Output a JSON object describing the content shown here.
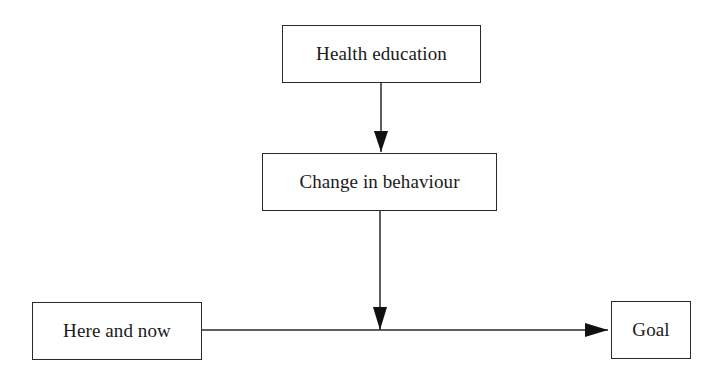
{
  "diagram": {
    "type": "flowchart",
    "nodes": {
      "health_education": {
        "label": "Health education"
      },
      "change_in_behaviour": {
        "label": "Change in behaviour"
      },
      "here_and_now": {
        "label": "Here and now"
      },
      "goal": {
        "label": "Goal"
      }
    },
    "edges": [
      {
        "from": "Health education",
        "to": "Change in behaviour"
      },
      {
        "from": "Change in behaviour",
        "to": "Here and now → Goal path (midpoint)"
      },
      {
        "from": "Here and now",
        "to": "Goal"
      }
    ],
    "colors": {
      "stroke": "#2a2a2a",
      "background": "#ffffff",
      "text": "#1a1a1a"
    }
  }
}
